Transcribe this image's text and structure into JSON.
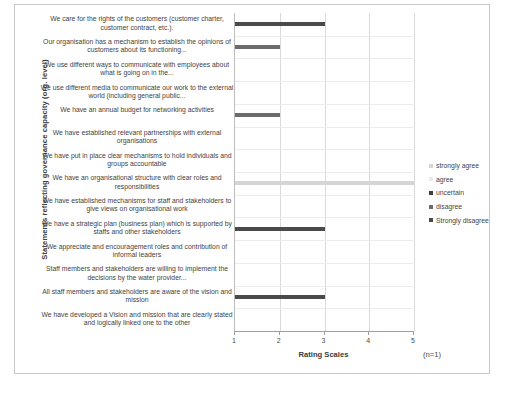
{
  "chart_data": {
    "type": "bar",
    "orientation": "horizontal",
    "title": "",
    "xlabel": "Rating Scales",
    "ylabel": "Statements reflecting governance capacity (org. level)",
    "xlim": [
      1,
      5
    ],
    "xticks": [
      "1",
      "2",
      "3",
      "4",
      "5"
    ],
    "grid": true,
    "annotation": "(n=1)",
    "legend_position": "right",
    "legend": [
      {
        "label": "strongly agree",
        "color": "#d5d5d5"
      },
      {
        "label": "agree",
        "color": "#eaeaea"
      },
      {
        "label": "uncertain",
        "color": "#3f3f3f"
      },
      {
        "label": "disagree",
        "color": "#6b6b6b"
      },
      {
        "label": "Strongly disagree",
        "color": "#4a4a4a"
      }
    ],
    "categories": [
      "We care for the rights of the customers (customer charter, customer contract, etc.).",
      "Our organisation has a mechanism to establish the opinions of customers about its functioning...",
      "We use different ways to communicate with employees about what is going on in the...",
      "We use different media to communicate our work to the external world (including general public...",
      "We have an annual budget for networking activities",
      "We have established relevant partnerships with external organisations",
      "We have put in place clear mechanisms to hold individuals and groups accountable",
      "We have an organisational structure with clear roles and responsibilities",
      "We have established mechanisms for staff and stakeholders to give views on organisational  work",
      "We have a strategic plan (business plan) which is supported by staffs and other stakeholders",
      "We appreciate and  encouragement  roles and contribution of informal leaders",
      "Staff members and stakeholders are willing to implement the decisions by the water provider...",
      "All staff members and stakeholders are aware of the  vision and mission",
      "We have developed a Vision and mission that are clearly stated and logically linked one to the other"
    ],
    "values": [
      3,
      2,
      null,
      null,
      2,
      null,
      null,
      5,
      null,
      3,
      null,
      null,
      3,
      null
    ],
    "bar_colors": [
      "#4a4a4a",
      "#6b6b6b",
      null,
      null,
      "#6b6b6b",
      null,
      null,
      "#d5d5d5",
      null,
      "#4a4a4a",
      null,
      null,
      "#4a4a4a",
      null
    ]
  }
}
